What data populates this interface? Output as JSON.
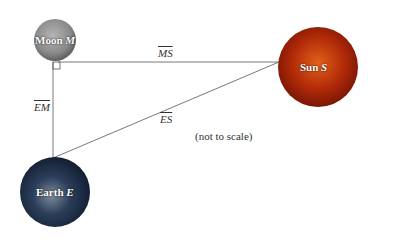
{
  "diagram": {
    "bodies": [
      {
        "id": "moon",
        "label": "Moon",
        "letter": "M",
        "color": "#8a8a8a"
      },
      {
        "id": "sun",
        "label": "Sun",
        "letter": "S",
        "color": "#b12a08"
      },
      {
        "id": "earth",
        "label": "Earth",
        "letter": "E",
        "color": "#1c2e4a"
      }
    ],
    "segments": {
      "ms": "MS",
      "em": "EM",
      "es": "ES"
    },
    "note": "(not to scale)"
  }
}
